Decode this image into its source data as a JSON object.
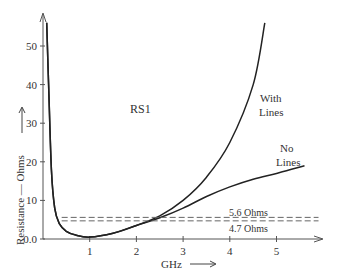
{
  "chart_data": {
    "type": "line",
    "title": "",
    "xlabel": "GHz",
    "ylabel": "Resistance — Ohms",
    "xlim": [
      0,
      5.9
    ],
    "ylim": [
      0,
      56
    ],
    "grid": false,
    "x_ticks": [
      "1",
      "2",
      "3",
      "4",
      "5"
    ],
    "y_ticks": [
      "0.0",
      "10",
      "20",
      "30",
      "40",
      "50"
    ],
    "annotations": [
      "RS1",
      "With Lines",
      "No Lines",
      "5.6 Ohms",
      "4.7 Ohms"
    ],
    "series": [
      {
        "name": "With Lines",
        "x": [
          0.08,
          0.12,
          0.18,
          0.25,
          0.35,
          0.5,
          0.7,
          1.0,
          1.5,
          2.0,
          2.5,
          3.0,
          3.5,
          4.0,
          4.5,
          4.75
        ],
        "values": [
          56,
          40,
          18,
          8,
          4,
          2,
          1,
          0.5,
          1.5,
          3.5,
          6,
          10,
          16,
          25,
          40,
          56
        ]
      },
      {
        "name": "No Lines",
        "x": [
          0.08,
          0.12,
          0.18,
          0.25,
          0.35,
          0.5,
          0.7,
          1.0,
          1.5,
          2.0,
          2.5,
          3.0,
          3.5,
          4.0,
          4.5,
          5.0,
          5.6
        ],
        "values": [
          56,
          40,
          18,
          8,
          4,
          2,
          1,
          0.5,
          1.5,
          3.5,
          5.5,
          8,
          11,
          13.5,
          15.5,
          17,
          19
        ]
      },
      {
        "name": "5.6 Ohms",
        "style": "dashed",
        "x": [
          0.4,
          5.9
        ],
        "values": [
          5.6,
          5.6
        ]
      },
      {
        "name": "4.7 Ohms",
        "style": "dashed",
        "x": [
          0.4,
          5.9
        ],
        "values": [
          4.7,
          4.7
        ]
      }
    ]
  },
  "labels": {
    "rs1": "RS1",
    "with_lines_1": "With",
    "with_lines_2": "Lines",
    "no_lines_1": "No",
    "no_lines_2": "Lines",
    "ref_56": "5.6 Ohms",
    "ref_47": "4.7 Ohms",
    "xlabel": "GHz",
    "ylabel": "Resistance — Ohms"
  }
}
